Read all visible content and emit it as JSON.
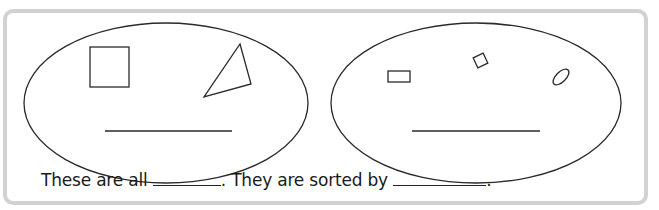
{
  "worksheet": {
    "groups": [
      {
        "label": "group-1",
        "shapes": [
          "square",
          "triangle"
        ],
        "answer_blank": ""
      },
      {
        "label": "group-2",
        "shapes": [
          "rectangle",
          "small-square",
          "small-oval"
        ],
        "answer_blank": ""
      }
    ],
    "sentence": {
      "part1": "These are all",
      "part2": ". They are sorted by",
      "part3": "."
    },
    "colors": {
      "frame_border": "#d2d2d2",
      "stroke": "#2a2a2a",
      "background": "#ffffff"
    }
  }
}
